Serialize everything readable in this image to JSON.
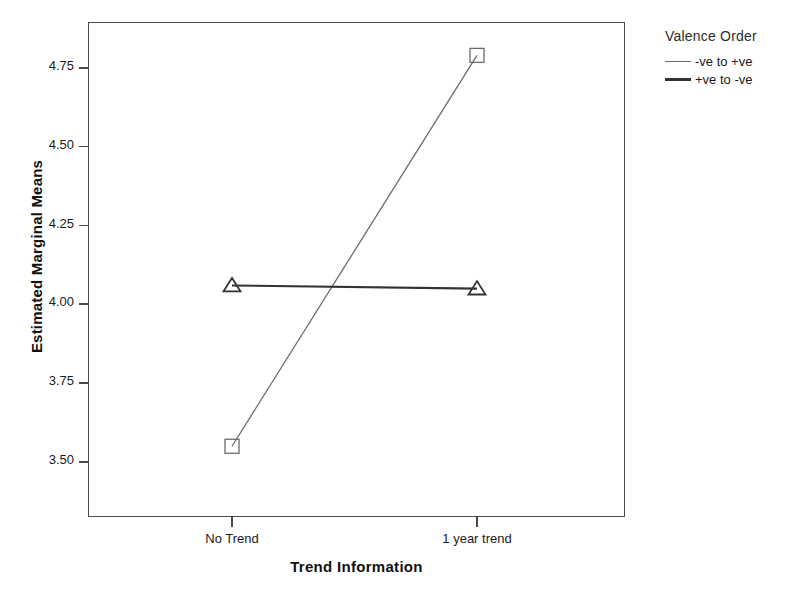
{
  "chart_data": {
    "type": "line",
    "title": "",
    "subtitle": "",
    "xlabel": "Trend Information",
    "ylabel": "Estimated Marginal Means",
    "categories": [
      "No Trend",
      "1 year trend"
    ],
    "yticks": [
      "3.50",
      "3.75",
      "4.00",
      "4.25",
      "4.50",
      "4.75"
    ],
    "ytick_values": [
      3.5,
      3.75,
      4.0,
      4.25,
      4.5,
      4.75
    ],
    "ylim": [
      3.33,
      4.9
    ],
    "grid": false,
    "legend_position": "right",
    "legend_title": "Valence Order",
    "series": [
      {
        "name": "-ve to +ve",
        "values": [
          3.55,
          4.79
        ],
        "marker": "square-open",
        "color": "#6b6b6b",
        "line_width": 1.3
      },
      {
        "name": "+ve to -ve",
        "values": [
          4.06,
          4.05
        ],
        "marker": "triangle-open",
        "color": "#333333",
        "line_width": 2.1
      }
    ]
  },
  "legend": {
    "title": "Valence Order",
    "entries": [
      {
        "label": "-ve to +ve"
      },
      {
        "label": "+ve to -ve"
      }
    ]
  }
}
